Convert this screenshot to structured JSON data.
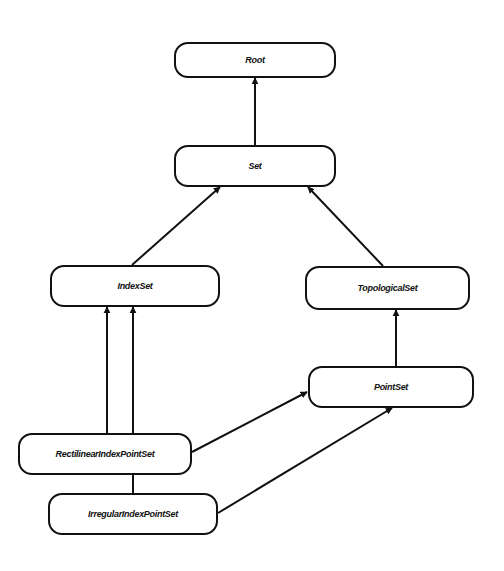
{
  "diagram": {
    "type": "class-hierarchy",
    "nodes": [
      {
        "id": "root",
        "label": "Root"
      },
      {
        "id": "set",
        "label": "Set"
      },
      {
        "id": "indexset",
        "label": "IndexSet"
      },
      {
        "id": "topologicalset",
        "label": "TopologicalSet"
      },
      {
        "id": "pointset",
        "label": "PointSet"
      },
      {
        "id": "rectilinear",
        "label": "RectilinearIndexPointSet"
      },
      {
        "id": "irregular",
        "label": "IrregularIndexPointSet"
      }
    ],
    "edges": [
      {
        "from": "set",
        "to": "root"
      },
      {
        "from": "indexset",
        "to": "set"
      },
      {
        "from": "topologicalset",
        "to": "set"
      },
      {
        "from": "pointset",
        "to": "topologicalset"
      },
      {
        "from": "rectilinear",
        "to": "indexset"
      },
      {
        "from": "irregular",
        "to": "indexset"
      },
      {
        "from": "rectilinear",
        "to": "pointset"
      },
      {
        "from": "irregular",
        "to": "pointset"
      }
    ],
    "colors": {
      "stroke": "#111111",
      "fill": "#ffffff",
      "background": "#ffffff"
    }
  }
}
